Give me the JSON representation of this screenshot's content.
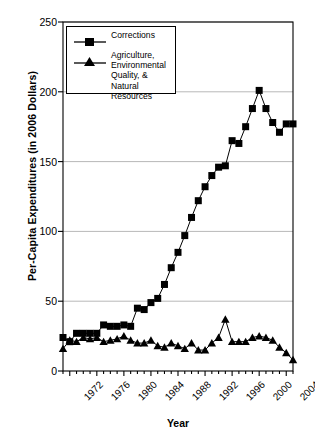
{
  "chart_data": {
    "type": "line",
    "title": "",
    "xlabel": "Year",
    "ylabel": "Per-Capita Expenditures (in 2006 Dollars)",
    "xlim": [
      1971,
      2005
    ],
    "ylim": [
      0,
      250
    ],
    "yticks": [
      0,
      50,
      100,
      150,
      200,
      250
    ],
    "xticks": [
      1972,
      1976,
      1980,
      1984,
      1988,
      1992,
      1996,
      2000,
      2004
    ],
    "xtick_labels": [
      "1972",
      "1976",
      "1980",
      "1984",
      "1988",
      "1992",
      "1996",
      "2000",
      "2004"
    ],
    "grid": "horizontal",
    "legend_position": "upper-left",
    "x": [
      1971,
      1972,
      1973,
      1974,
      1975,
      1976,
      1977,
      1978,
      1979,
      1980,
      1981,
      1982,
      1983,
      1984,
      1985,
      1986,
      1987,
      1988,
      1989,
      1990,
      1991,
      1992,
      1993,
      1994,
      1995,
      1996,
      1997,
      1998,
      1999,
      2000,
      2001,
      2002,
      2003,
      2004,
      2005
    ],
    "series": [
      {
        "name": "Corrections",
        "marker": "square",
        "color": "#000000",
        "values": [
          24,
          21,
          27,
          27,
          27,
          27,
          33,
          32,
          32,
          33,
          32,
          45,
          44,
          49,
          52,
          62,
          74,
          85,
          97,
          110,
          122,
          132,
          140,
          146,
          147,
          165,
          163,
          175,
          188,
          201,
          188,
          178,
          171,
          177,
          177
        ]
      },
      {
        "name": "Agriculture, Environmental Quality, & Natural Resources",
        "marker": "triangle",
        "color": "#000000",
        "values": [
          16,
          22,
          21,
          24,
          23,
          24,
          21,
          22,
          23,
          25,
          22,
          20,
          20,
          22,
          18,
          17,
          20,
          18,
          16,
          20,
          15,
          15,
          20,
          24,
          37,
          21,
          21,
          21,
          24,
          25,
          24,
          22,
          17,
          13,
          8
        ]
      }
    ]
  },
  "legend": {
    "entries": [
      {
        "label": "Corrections",
        "marker": "square"
      },
      {
        "label": "Agriculture, Environmental Quality, & Natural Resources",
        "marker": "triangle"
      }
    ]
  }
}
